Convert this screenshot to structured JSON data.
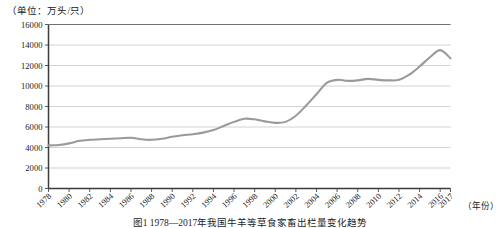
{
  "unit_label": "（单位：万头/只）",
  "caption": "图1  1978—2017年我国牛羊等草食家畜出栏量变化趋势",
  "colors": {
    "line": "#9a9a9a",
    "grid": "#c8c8c8",
    "axis": "#4a4a4a",
    "text": "#1a1a1a",
    "background": "#ffffff"
  },
  "chart_data": {
    "type": "line",
    "title": "",
    "subtitle": "",
    "xlabel": "（年份）",
    "ylabel": "（单位：万头/只）",
    "ylim": [
      0,
      16000
    ],
    "ytick_step": 2000,
    "yticks": [
      0,
      2000,
      4000,
      6000,
      8000,
      10000,
      12000,
      14000,
      16000
    ],
    "ytick_labels": [
      "0",
      "2000",
      "4000",
      "6000",
      "8000",
      "10000",
      "12000",
      "14000",
      "16000"
    ],
    "xlim": [
      1978,
      2017
    ],
    "xticks": [
      1978,
      1980,
      1982,
      1984,
      1986,
      1988,
      1990,
      1992,
      1994,
      1996,
      1998,
      2000,
      2002,
      2004,
      2006,
      2008,
      2010,
      2012,
      2014,
      2016,
      2017
    ],
    "xtick_labels": [
      "1978",
      "1980",
      "1982",
      "1984",
      "1986",
      "1988",
      "1990",
      "1992",
      "1994",
      "1996",
      "1998",
      "2000",
      "2002",
      "2004",
      "2006",
      "2008",
      "2010",
      "2012",
      "2014",
      "2016",
      "2017"
    ],
    "grid": "horizontal",
    "legend": "none",
    "series": [
      {
        "name": "草食家畜出栏量",
        "color": "#9a9a9a",
        "x": [
          1978,
          1979,
          1980,
          1981,
          1982,
          1983,
          1984,
          1985,
          1986,
          1987,
          1988,
          1989,
          1990,
          1991,
          1992,
          1993,
          1994,
          1995,
          1996,
          1997,
          1998,
          1999,
          2000,
          2001,
          2002,
          2003,
          2004,
          2005,
          2006,
          2007,
          2008,
          2009,
          2010,
          2011,
          2012,
          2013,
          2014,
          2015,
          2016,
          2017
        ],
        "values": [
          4200,
          4250,
          4400,
          4650,
          4750,
          4800,
          4850,
          4900,
          4950,
          4800,
          4750,
          4850,
          5050,
          5200,
          5300,
          5450,
          5700,
          6100,
          6500,
          6800,
          6750,
          6550,
          6400,
          6500,
          7100,
          8100,
          9200,
          10300,
          10600,
          10500,
          10550,
          10700,
          10600,
          10550,
          10600,
          11100,
          11900,
          12800,
          13500,
          12700
        ]
      }
    ]
  }
}
